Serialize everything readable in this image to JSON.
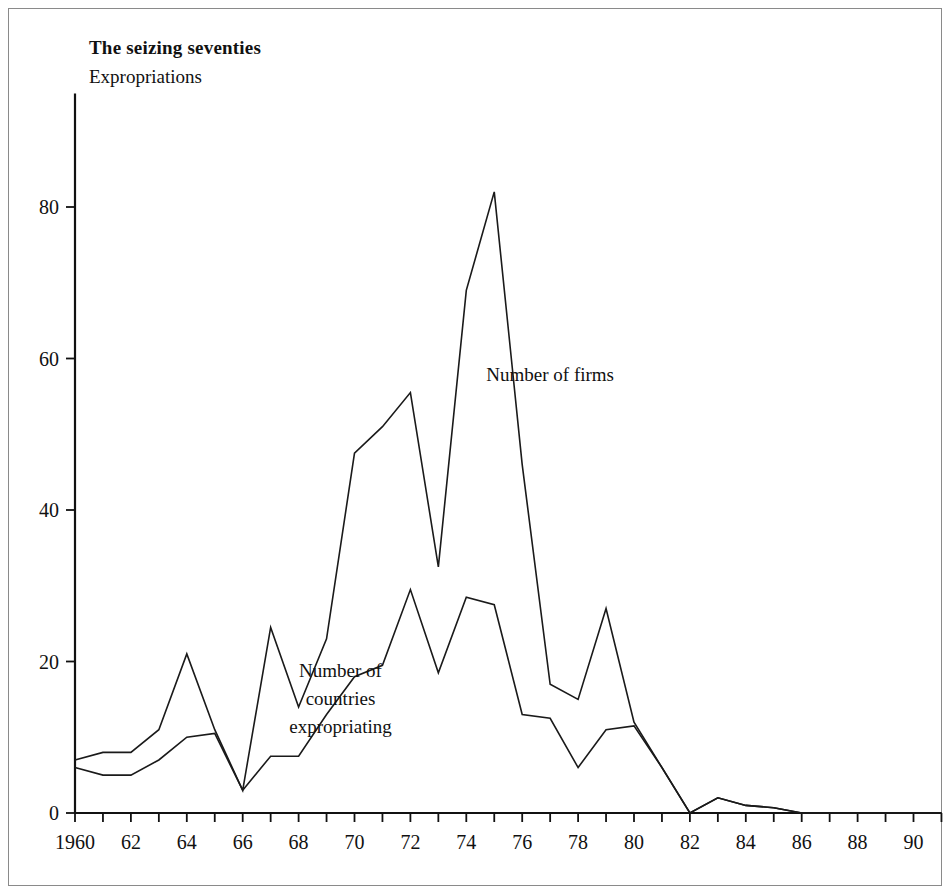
{
  "chart_data": {
    "type": "line",
    "title": "The seizing seventies",
    "subtitle": "Expropriations",
    "xlabel": "",
    "ylabel": "",
    "xlim": [
      1960,
      1991
    ],
    "ylim": [
      0,
      95
    ],
    "yticks": [
      0,
      20,
      40,
      60,
      80
    ],
    "ytick_labels": [
      "0",
      "20",
      "40",
      "60",
      "80"
    ],
    "xticks": [
      1960,
      1961,
      1962,
      1963,
      1964,
      1965,
      1966,
      1967,
      1968,
      1969,
      1970,
      1971,
      1972,
      1973,
      1974,
      1975,
      1976,
      1977,
      1978,
      1979,
      1980,
      1981,
      1982,
      1983,
      1984,
      1985,
      1986,
      1987,
      1988,
      1989,
      1990,
      1991
    ],
    "xtick_labels": [
      "1960",
      "62",
      "64",
      "66",
      "68",
      "70",
      "72",
      "74",
      "76",
      "78",
      "80",
      "82",
      "84",
      "86",
      "88",
      "90"
    ],
    "xtick_label_years": [
      1960,
      1962,
      1964,
      1966,
      1968,
      1970,
      1972,
      1974,
      1976,
      1978,
      1980,
      1982,
      1984,
      1986,
      1988,
      1990
    ],
    "grid": false,
    "legend": "inline-annotations",
    "x": [
      1960,
      1961,
      1962,
      1963,
      1964,
      1965,
      1966,
      1967,
      1968,
      1969,
      1970,
      1971,
      1972,
      1973,
      1974,
      1975,
      1976,
      1977,
      1978,
      1979,
      1980,
      1981,
      1982,
      1983,
      1984,
      1985,
      1986,
      1987,
      1988,
      1989,
      1990,
      1991
    ],
    "series": [
      {
        "name": "Number of firms",
        "color": "#1a1a1a",
        "values": [
          7,
          8,
          8,
          11,
          21,
          11,
          3,
          24.5,
          14,
          23,
          47.5,
          51,
          55.5,
          32.5,
          69,
          82,
          46,
          17,
          15,
          27,
          12,
          6,
          0,
          2,
          1,
          0.7,
          0,
          0,
          0,
          0,
          0,
          0
        ]
      },
      {
        "name": "Number of countries expropriating",
        "color": "#1a1a1a",
        "values": [
          6,
          5,
          5,
          7,
          10,
          10.5,
          3,
          7.5,
          7.5,
          13,
          18,
          19.5,
          29.5,
          18.5,
          28.5,
          27.5,
          13,
          12.5,
          6,
          11,
          11.5,
          6,
          0,
          2,
          1,
          0.7,
          0,
          0,
          0,
          0,
          0,
          0
        ]
      }
    ],
    "annotations": [
      {
        "text": "Number of firms",
        "x": 1977,
        "y": 57
      },
      {
        "text_lines": [
          "Number of",
          "countries",
          "expropriating"
        ],
        "x": 1969.5,
        "y": 18
      }
    ]
  },
  "annotation_labels": {
    "firms": "Number of firms",
    "countries_line1": "Number of",
    "countries_line2": "countries",
    "countries_line3": "expropriating"
  }
}
